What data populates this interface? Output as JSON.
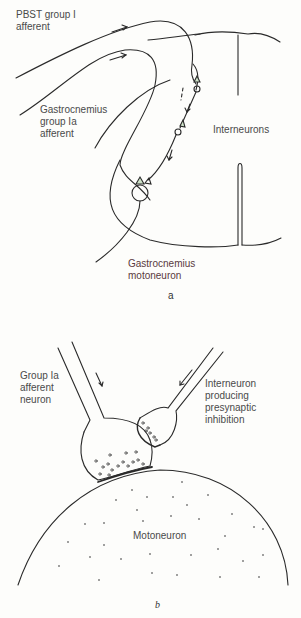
{
  "figure": {
    "panel_a": {
      "panel_label": "a",
      "labels": {
        "pbst_afferent": "PBST group I\nafferent",
        "gastrocnemius_afferent": "Gastrocnemius\ngroup Ia\nafferent",
        "interneurons": "Interneurons",
        "gastrocnemius_motoneuron": "Gastrocnemius\nmotoneuron"
      }
    },
    "panel_b": {
      "panel_label": "b",
      "labels": {
        "group_ia_afferent": "Group Ia\nafferent\nneuron",
        "interneuron_presynaptic": "Interneuron\nproducing\npresynaptic\ninhibition",
        "motoneuron": "Motoneuron"
      }
    },
    "colors": {
      "line": "#2a2a2a",
      "background": "#fdfdfb",
      "synapse_fill": "#cfe3c9",
      "label_accent": "#7a3b4a"
    }
  }
}
